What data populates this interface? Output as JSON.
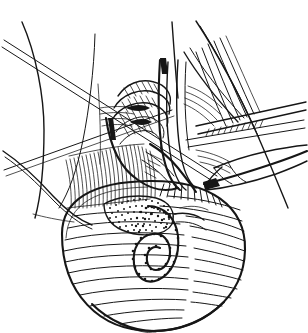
{
  "figure": {
    "title": "Surgical exposure of testis and spermatic cord",
    "medium": "pen-and-ink line drawing",
    "background_color": "#ffffff",
    "ink_color": "#161616",
    "width": 308,
    "height": 333,
    "has_text_labels": false,
    "caption": ""
  },
  "regions": [
    {
      "id": "skin-flap-left",
      "label": "Retracted skin flap (left)"
    },
    {
      "id": "skin-flap-right",
      "label": "Retracted skin flap (right)"
    },
    {
      "id": "suture-needle",
      "label": "Suture with straight needle"
    },
    {
      "id": "cord-vessels",
      "label": "Spermatic cord vessel bundle"
    },
    {
      "id": "cord-sheath",
      "label": "Divided cord sheath"
    },
    {
      "id": "coiled-vessels",
      "label": "Coiled pampiniform vessels"
    },
    {
      "id": "forceps-upper",
      "label": "Upper forceps / clamp"
    },
    {
      "id": "forceps-lower",
      "label": "Lower forceps tip"
    },
    {
      "id": "fat-pad",
      "label": "Stippled fat pad"
    },
    {
      "id": "testis",
      "label": "Testis"
    },
    {
      "id": "epididymis",
      "label": "Epididymis loop"
    },
    {
      "id": "tunica-hatching",
      "label": "Tunica surface hatching"
    }
  ],
  "strokes": {
    "flap_left_outer": "M 22 22 C 36 54 44 96 44 130 C 44 166 40 194 34 216",
    "flap_left_inner": "M 95 36 C 93 72 88 110 82 140 C 76 170 68 192 58 208",
    "flap_left_edge": "M 4 152 C 18 162 34 176 52 196 C 66 211 78 220 90 224",
    "flap_right_outer": "M 196 22 C 216 52 240 96 258 136 C 272 168 282 192 288 208",
    "flap_right_inner": "M 210 44 C 224 70 240 100 252 124",
    "needle_a": "M 3 47 L 213 181",
    "needle_b": "M 5 41 L 216 176",
    "needle_c": "M 6 169 L 170 112",
    "clamp_top": "M 238 146 L 307 166",
    "clamp_bottom": "M 206 184 L 306 176",
    "testis_outline": "M 62 232 C 62 196 94 182 150 182 C 212 182 244 204 244 248 C 244 296 202 330 152 330 C 100 330 62 292 62 232"
  },
  "hatch_fields": [
    {
      "id": "flap-under-hatch",
      "x": 66,
      "y": 156,
      "w": 72,
      "h": 56,
      "count": 24,
      "angle": 80
    },
    {
      "id": "cord-hatch",
      "x": 174,
      "y": 64,
      "w": 58,
      "h": 92,
      "count": 20,
      "angle": 18
    },
    {
      "id": "testis-hatch",
      "x": 64,
      "y": 196,
      "w": 180,
      "h": 132,
      "count": 22,
      "angle": 0
    },
    {
      "id": "stipple-pad",
      "x": 104,
      "y": 198,
      "w": 62,
      "h": 34,
      "count": 170
    }
  ]
}
